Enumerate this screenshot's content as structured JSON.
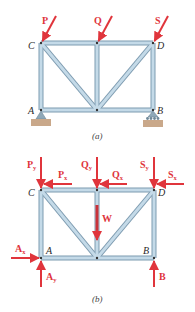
{
  "figure_a": {
    "caption": "(a)",
    "joints": {
      "C": "C",
      "D": "D",
      "A": "A",
      "B": "B"
    },
    "loads": {
      "P": "P",
      "Q": "Q",
      "S": "S"
    }
  },
  "figure_b": {
    "caption": "(b)",
    "joints": {
      "C": "C",
      "D": "D",
      "A": "A",
      "B": "B"
    },
    "forces": {
      "Py": {
        "base": "P",
        "sub": "y"
      },
      "Px": {
        "base": "P",
        "sub": "x"
      },
      "Qy": {
        "base": "Q",
        "sub": "y"
      },
      "Qx": {
        "base": "Q",
        "sub": "x"
      },
      "Sy": {
        "base": "S",
        "sub": "y"
      },
      "Sx": {
        "base": "S",
        "sub": "x"
      },
      "Ax": {
        "base": "A",
        "sub": "x"
      },
      "Ay": {
        "base": "A",
        "sub": "y"
      },
      "B": "B",
      "W": "W"
    }
  },
  "colors": {
    "member": "#a9c4d6",
    "member_edge": "#7d9bb0",
    "force": "#e0353c",
    "ground": "#c9a88a"
  }
}
